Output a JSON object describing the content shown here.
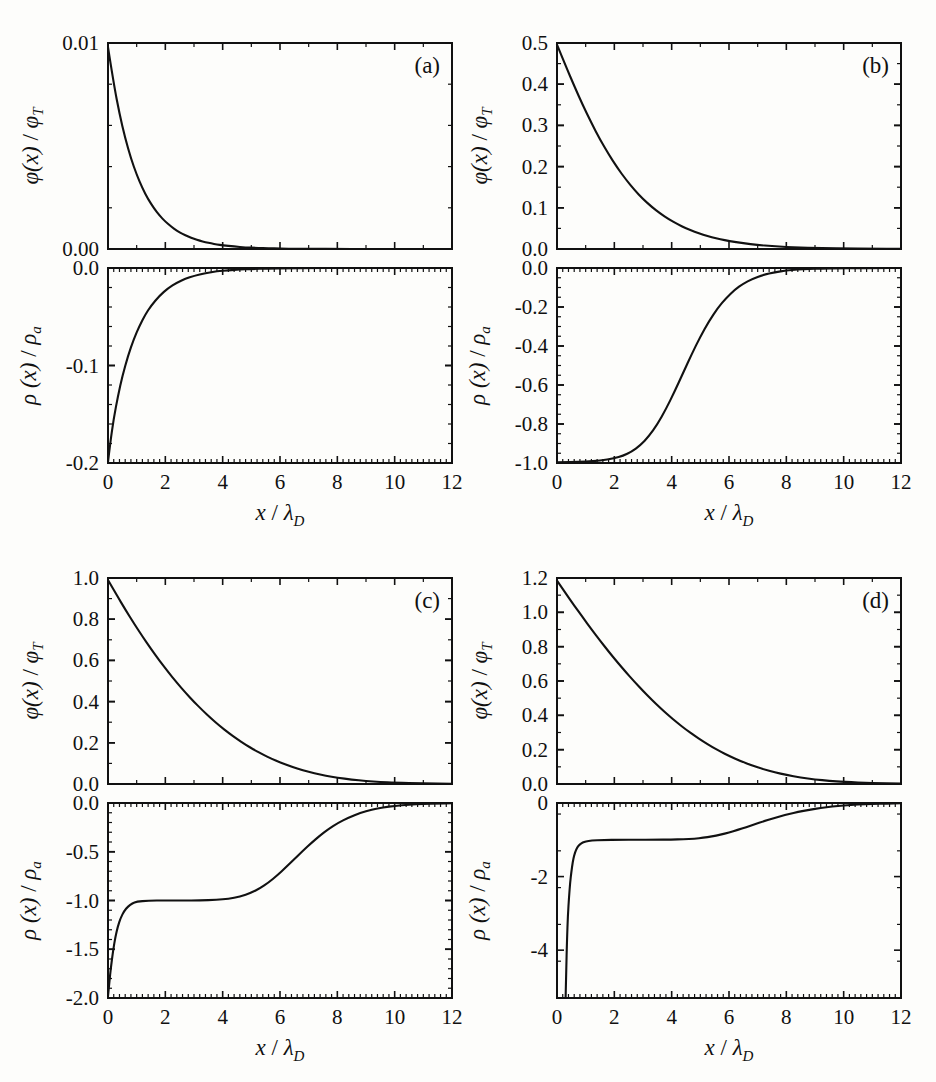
{
  "figure": {
    "width": 936,
    "height": 1082,
    "background": "#fdfdfb",
    "curve_color": "#111111",
    "axis_color": "#111111"
  },
  "axis_labels": {
    "x": "x / λ_D",
    "x_main": "x",
    "x_slash": "/",
    "x_sym": "λ",
    "x_sub": "D",
    "phi_main": "φ(x)",
    "phi_slash": "/",
    "phi_sym": "φ",
    "phi_sub": "T",
    "rho_main": "ρ (x)",
    "rho_slash": "/",
    "rho_sym": "ρ",
    "rho_sub": "a",
    "phi_full": "φ(x) / φ_T",
    "rho_full": "ρ(x) / ρ_a"
  },
  "chart_data": [
    {
      "id": "a-top",
      "panel": "(a)",
      "type": "line",
      "title": "",
      "xlabel": "x / λ_D",
      "ylabel": "φ(x) / φ_T",
      "xlim": [
        0,
        12
      ],
      "ylim": [
        0,
        0.01
      ],
      "xticks": [
        0,
        2,
        4,
        6,
        8,
        10,
        12
      ],
      "xticklabels": [
        "",
        "",
        "",
        "",
        "",
        "",
        ""
      ],
      "yticks": [
        0.0,
        0.01
      ],
      "yticklabels": [
        "0.00",
        "0.01"
      ],
      "xminor_step": 1,
      "yminor_step": 0.002,
      "grid": false,
      "legend": "none",
      "x": [
        0,
        0.2,
        0.4,
        0.6,
        0.8,
        1.0,
        1.2,
        1.4,
        1.6,
        1.8,
        2.0,
        2.2,
        2.4,
        2.6,
        2.8,
        3.0,
        3.2,
        3.4,
        3.6,
        3.8,
        4.0,
        4.4,
        4.8,
        5.2,
        5.6,
        6.0,
        6.6,
        7.2,
        8.0,
        9.0,
        10.0,
        11.0,
        12.0
      ],
      "y": [
        0.0098,
        0.00802,
        0.00657,
        0.00538,
        0.0044,
        0.00361,
        0.00295,
        0.00242,
        0.00198,
        0.00162,
        0.00133,
        0.00109,
        0.00089,
        0.00073,
        0.0006,
        0.00049,
        0.0004,
        0.00033,
        0.00027,
        0.00022,
        0.00018,
        0.00012,
        8e-05,
        5e-05,
        4e-05,
        2e-05,
        1e-05,
        1e-05,
        0.0,
        0.0,
        0.0,
        0.0,
        0.0
      ]
    },
    {
      "id": "a-bottom",
      "panel": "(a)",
      "type": "line",
      "title": "",
      "xlabel": "x / λ_D",
      "ylabel": "ρ(x) / ρ_a",
      "xlim": [
        0,
        12
      ],
      "ylim": [
        -0.2,
        0.0
      ],
      "xticks": [
        0,
        2,
        4,
        6,
        8,
        10,
        12
      ],
      "xticklabels": [
        "0",
        "2",
        "4",
        "6",
        "8",
        "10",
        "12"
      ],
      "yticks": [
        -0.2,
        -0.1,
        0.0
      ],
      "yticklabels": [
        "-0.2",
        "-0.1",
        "0.0"
      ],
      "xminor_step": 0.2,
      "yminor_step": 0.02,
      "grid": false,
      "legend": "none",
      "x": [
        0,
        0.08,
        0.2,
        0.35,
        0.5,
        0.7,
        0.9,
        1.1,
        1.3,
        1.5,
        1.8,
        2.1,
        2.4,
        2.7,
        3.0,
        3.4,
        3.8,
        4.2,
        4.6,
        5.0,
        5.6,
        6.2,
        7.0,
        8.0,
        9.0,
        10.0,
        11.0,
        12.0
      ],
      "y": [
        -0.199,
        -0.179,
        -0.1545,
        -0.131,
        -0.111,
        -0.09,
        -0.073,
        -0.0592,
        -0.0478,
        -0.0388,
        -0.0283,
        -0.0206,
        -0.015,
        -0.011,
        -0.008,
        -0.0052,
        -0.0034,
        -0.0023,
        -0.0015,
        -0.001,
        -0.0005,
        -0.0003,
        -0.0001,
        0.0,
        0.0,
        0.0,
        0.0,
        0.0
      ]
    },
    {
      "id": "b-top",
      "panel": "(b)",
      "type": "line",
      "title": "",
      "xlabel": "x / λ_D",
      "ylabel": "φ(x) / φ_T",
      "xlim": [
        0,
        12
      ],
      "ylim": [
        0,
        0.5
      ],
      "xticks": [
        0,
        2,
        4,
        6,
        8,
        10,
        12
      ],
      "xticklabels": [
        "",
        "",
        "",
        "",
        "",
        "",
        ""
      ],
      "yticks": [
        0.0,
        0.1,
        0.2,
        0.3,
        0.4,
        0.5
      ],
      "yticklabels": [
        "0.0",
        "0.1",
        "0.2",
        "0.3",
        "0.4",
        "0.5"
      ],
      "xminor_step": 1,
      "yminor_step": 0.05,
      "grid": false,
      "legend": "none",
      "x": [
        0,
        0.3,
        0.6,
        0.9,
        1.2,
        1.5,
        1.8,
        2.1,
        2.4,
        2.7,
        3.0,
        3.3,
        3.6,
        3.9,
        4.2,
        4.5,
        4.8,
        5.1,
        5.4,
        5.7,
        6.0,
        6.5,
        7.0,
        7.5,
        8.0,
        8.5,
        9.0,
        9.5,
        10.0,
        11.0,
        12.0
      ],
      "y": [
        0.496,
        0.445,
        0.396,
        0.349,
        0.306,
        0.266,
        0.23,
        0.1975,
        0.169,
        0.1435,
        0.1215,
        0.1025,
        0.0862,
        0.0722,
        0.0604,
        0.0503,
        0.0418,
        0.0346,
        0.0286,
        0.0236,
        0.0194,
        0.0139,
        0.0099,
        0.007,
        0.0049,
        0.0034,
        0.0024,
        0.0017,
        0.0012,
        0.0006,
        0.0003
      ]
    },
    {
      "id": "b-bottom",
      "panel": "(b)",
      "type": "line",
      "title": "",
      "xlabel": "x / λ_D",
      "ylabel": "ρ(x) / ρ_a",
      "xlim": [
        0,
        12
      ],
      "ylim": [
        -1.0,
        0.0
      ],
      "xticks": [
        0,
        2,
        4,
        6,
        8,
        10,
        12
      ],
      "xticklabels": [
        "0",
        "2",
        "4",
        "6",
        "8",
        "10",
        "12"
      ],
      "yticks": [
        -1.0,
        -0.8,
        -0.6,
        -0.4,
        -0.2,
        0.0
      ],
      "yticklabels": [
        "-1.0",
        "-0.8",
        "-0.6",
        "-0.4",
        "-0.2",
        "0.0"
      ],
      "xminor_step": 0.2,
      "yminor_step": 0.05,
      "grid": false,
      "legend": "none",
      "x": [
        0,
        0.5,
        1.0,
        1.5,
        2.0,
        2.3,
        2.6,
        2.9,
        3.2,
        3.5,
        3.8,
        4.1,
        4.4,
        4.7,
        5.0,
        5.3,
        5.6,
        5.9,
        6.2,
        6.5,
        6.8,
        7.2,
        7.6,
        8.0,
        8.4,
        8.8,
        9.2,
        9.8,
        10.4,
        11.2,
        12.0
      ],
      "y": [
        -0.996,
        -0.995,
        -0.993,
        -0.988,
        -0.976,
        -0.963,
        -0.942,
        -0.91,
        -0.864,
        -0.802,
        -0.724,
        -0.634,
        -0.538,
        -0.442,
        -0.352,
        -0.273,
        -0.207,
        -0.154,
        -0.112,
        -0.08,
        -0.0565,
        -0.035,
        -0.0215,
        -0.013,
        -0.008,
        -0.0048,
        -0.0029,
        -0.0013,
        -0.0006,
        -0.0002,
        -0.0001
      ]
    },
    {
      "id": "c-top",
      "panel": "(c)",
      "type": "line",
      "title": "",
      "xlabel": "x / λ_D",
      "ylabel": "φ(x) / φ_T",
      "xlim": [
        0,
        12
      ],
      "ylim": [
        0,
        1.0
      ],
      "xticks": [
        0,
        2,
        4,
        6,
        8,
        10,
        12
      ],
      "xticklabels": [
        "",
        "",
        "",
        "",
        "",
        "",
        ""
      ],
      "yticks": [
        0.0,
        0.2,
        0.4,
        0.6,
        0.8,
        1.0
      ],
      "yticklabels": [
        "0.0",
        "0.2",
        "0.4",
        "0.6",
        "0.8",
        "1.0"
      ],
      "xminor_step": 1,
      "yminor_step": 0.1,
      "grid": false,
      "legend": "none",
      "x": [
        0,
        0.3,
        0.6,
        0.9,
        1.2,
        1.5,
        1.8,
        2.1,
        2.4,
        2.7,
        3.0,
        3.3,
        3.6,
        3.9,
        4.2,
        4.5,
        4.8,
        5.1,
        5.4,
        5.7,
        6.0,
        6.4,
        6.8,
        7.2,
        7.6,
        8.0,
        8.5,
        9.0,
        9.5,
        10.0,
        11.0,
        12.0
      ],
      "y": [
        0.99,
        0.918,
        0.848,
        0.781,
        0.717,
        0.656,
        0.598,
        0.543,
        0.492,
        0.444,
        0.399,
        0.357,
        0.318,
        0.282,
        0.249,
        0.219,
        0.191,
        0.166,
        0.143,
        0.123,
        0.105,
        0.084,
        0.0665,
        0.052,
        0.0402,
        0.0308,
        0.0215,
        0.0147,
        0.01,
        0.0067,
        0.0029,
        0.0012
      ]
    },
    {
      "id": "c-bottom",
      "panel": "(c)",
      "type": "line",
      "title": "",
      "xlabel": "x / λ_D",
      "ylabel": "ρ(x) / ρ_a",
      "xlim": [
        0,
        12
      ],
      "ylim": [
        -2.0,
        0.0
      ],
      "xticks": [
        0,
        2,
        4,
        6,
        8,
        10,
        12
      ],
      "xticklabels": [
        "0",
        "2",
        "4",
        "6",
        "8",
        "10",
        "12"
      ],
      "yticks": [
        -2.0,
        -1.5,
        -1.0,
        -0.5,
        0.0
      ],
      "yticklabels": [
        "-2.0",
        "-1.5",
        "-1.0",
        "-0.5",
        "0.0"
      ],
      "xminor_step": 0.2,
      "yminor_step": 0.1,
      "grid": false,
      "legend": "none",
      "x": [
        0,
        0.05,
        0.1,
        0.18,
        0.26,
        0.34,
        0.44,
        0.56,
        0.7,
        0.85,
        1.0,
        1.4,
        2.0,
        2.6,
        3.2,
        3.8,
        4.2,
        4.6,
        5.0,
        5.3,
        5.6,
        5.9,
        6.2,
        6.5,
        6.8,
        7.1,
        7.4,
        7.7,
        8.0,
        8.4,
        8.8,
        9.2,
        9.6,
        10.0,
        10.5,
        11.0,
        11.5,
        12.0
      ],
      "y": [
        -1.98,
        -1.83,
        -1.69,
        -1.51,
        -1.37,
        -1.27,
        -1.18,
        -1.11,
        -1.06,
        -1.028,
        -1.012,
        -1.001,
        -1.0,
        -1.0,
        -0.999,
        -0.993,
        -0.982,
        -0.96,
        -0.92,
        -0.875,
        -0.815,
        -0.743,
        -0.662,
        -0.576,
        -0.49,
        -0.408,
        -0.332,
        -0.265,
        -0.208,
        -0.148,
        -0.102,
        -0.069,
        -0.0455,
        -0.0295,
        -0.016,
        -0.0085,
        -0.0045,
        -0.0025
      ]
    },
    {
      "id": "d-top",
      "panel": "(d)",
      "type": "line",
      "title": "",
      "xlabel": "x / λ_D",
      "ylabel": "φ(x) / φ_T",
      "xlim": [
        0,
        12
      ],
      "ylim": [
        0,
        1.2
      ],
      "xticks": [
        0,
        2,
        4,
        6,
        8,
        10,
        12
      ],
      "xticklabels": [
        "",
        "",
        "",
        "",
        "",
        "",
        ""
      ],
      "yticks": [
        0.0,
        0.2,
        0.4,
        0.6,
        0.8,
        1.0,
        1.2
      ],
      "yticklabels": [
        "0.0",
        "0.2",
        "0.4",
        "0.6",
        "0.8",
        "1.0",
        "1.2"
      ],
      "xminor_step": 1,
      "yminor_step": 0.1,
      "grid": false,
      "legend": "none",
      "x": [
        0,
        0.3,
        0.6,
        0.9,
        1.2,
        1.5,
        1.8,
        2.1,
        2.4,
        2.7,
        3.0,
        3.3,
        3.6,
        3.9,
        4.2,
        4.5,
        4.8,
        5.1,
        5.4,
        5.7,
        6.0,
        6.4,
        6.8,
        7.2,
        7.6,
        8.0,
        8.5,
        9.0,
        9.5,
        10.0,
        11.0,
        12.0
      ],
      "y": [
        1.185,
        1.112,
        1.04,
        0.97,
        0.902,
        0.836,
        0.772,
        0.711,
        0.652,
        0.596,
        0.542,
        0.491,
        0.443,
        0.398,
        0.356,
        0.317,
        0.281,
        0.248,
        0.217,
        0.189,
        0.164,
        0.134,
        0.108,
        0.086,
        0.068,
        0.053,
        0.038,
        0.0266,
        0.0184,
        0.0126,
        0.0057,
        0.0025
      ]
    },
    {
      "id": "d-bottom",
      "panel": "(d)",
      "type": "line",
      "title": "",
      "xlabel": "x / λ_D",
      "ylabel": "ρ(x) / ρ_a",
      "xlim": [
        0,
        12
      ],
      "ylim": [
        -5.3,
        0.0
      ],
      "xticks": [
        0,
        2,
        4,
        6,
        8,
        10,
        12
      ],
      "xticklabels": [
        "0",
        "2",
        "4",
        "6",
        "8",
        "10",
        "12"
      ],
      "yticks": [
        -4,
        -2,
        0
      ],
      "yticklabels": [
        "-4",
        "-2",
        "0"
      ],
      "xminor_step": 0.2,
      "yminor_step": 1,
      "grid": false,
      "legend": "none",
      "x": [
        0.3,
        0.32,
        0.35,
        0.38,
        0.42,
        0.46,
        0.5,
        0.55,
        0.6,
        0.66,
        0.72,
        0.8,
        0.9,
        1.0,
        1.2,
        1.6,
        2.2,
        2.8,
        3.4,
        4.0,
        4.4,
        4.8,
        5.1,
        5.4,
        5.7,
        6.0,
        6.3,
        6.6,
        6.9,
        7.2,
        7.5,
        7.8,
        8.1,
        8.4,
        8.8,
        9.2,
        9.6,
        10.0,
        10.5,
        11.0,
        11.5,
        12.0
      ],
      "y": [
        -5.3,
        -4.6,
        -3.7,
        -3.05,
        -2.55,
        -2.15,
        -1.88,
        -1.6,
        -1.42,
        -1.28,
        -1.19,
        -1.12,
        -1.07,
        -1.045,
        -1.018,
        -1.003,
        -1.0,
        -1.0,
        -0.999,
        -0.994,
        -0.986,
        -0.968,
        -0.945,
        -0.91,
        -0.862,
        -0.802,
        -0.732,
        -0.656,
        -0.578,
        -0.501,
        -0.427,
        -0.359,
        -0.298,
        -0.244,
        -0.184,
        -0.135,
        -0.097,
        -0.068,
        -0.041,
        -0.024,
        -0.0135,
        -0.0075
      ]
    }
  ],
  "panels": {
    "a": {
      "letter": "(a)"
    },
    "b": {
      "letter": "(b)"
    },
    "c": {
      "letter": "(c)"
    },
    "d": {
      "letter": "(d)"
    }
  }
}
